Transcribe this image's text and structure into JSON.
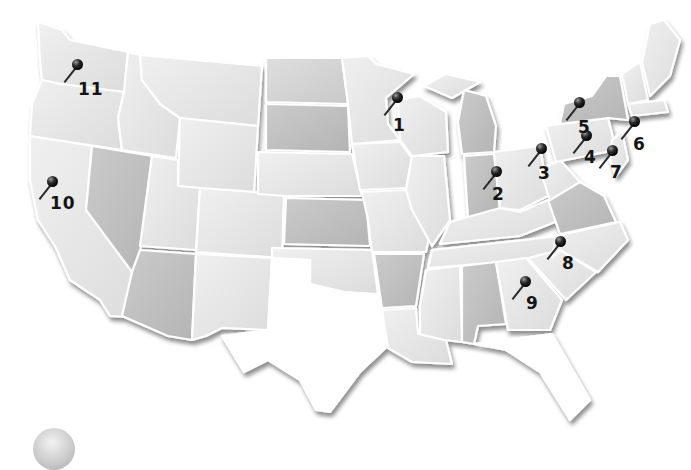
{
  "map": {
    "title": "United States locations map",
    "colors": {
      "background": "#ffffff",
      "state_light": "#e6e6e6",
      "state_mid": "#d2d2d2",
      "state_dark": "#bcbcbc",
      "border": "#ffffff",
      "pin": "#111111",
      "label": "#151515"
    },
    "pins": [
      {
        "id": 1,
        "label": "1",
        "state": "Minnesota/Wisconsin border",
        "x": 397,
        "y": 98,
        "label_x": 393,
        "label_y": 117
      },
      {
        "id": 2,
        "label": "2",
        "state": "Indiana",
        "x": 496,
        "y": 172,
        "label_x": 492,
        "label_y": 186
      },
      {
        "id": 3,
        "label": "3",
        "state": "Ohio",
        "x": 541,
        "y": 149,
        "label_x": 538,
        "label_y": 165
      },
      {
        "id": 4,
        "label": "4",
        "state": "Pennsylvania",
        "x": 586,
        "y": 136,
        "label_x": 584,
        "label_y": 149
      },
      {
        "id": 5,
        "label": "5",
        "state": "New York",
        "x": 579,
        "y": 103,
        "label_x": 578,
        "label_y": 119
      },
      {
        "id": 6,
        "label": "6",
        "state": "Connecticut",
        "x": 634,
        "y": 122,
        "label_x": 633,
        "label_y": 136
      },
      {
        "id": 7,
        "label": "7",
        "state": "New Jersey",
        "x": 612,
        "y": 151,
        "label_x": 610,
        "label_y": 164
      },
      {
        "id": 8,
        "label": "8",
        "state": "North Carolina",
        "x": 560,
        "y": 242,
        "label_x": 562,
        "label_y": 255
      },
      {
        "id": 9,
        "label": "9",
        "state": "Georgia",
        "x": 525,
        "y": 282,
        "label_x": 526,
        "label_y": 295
      },
      {
        "id": 10,
        "label": "10",
        "state": "California",
        "x": 52,
        "y": 182,
        "label_x": 50,
        "label_y": 195
      },
      {
        "id": 11,
        "label": "11",
        "state": "Washington",
        "x": 77,
        "y": 65,
        "label_x": 78,
        "label_y": 81
      }
    ]
  }
}
